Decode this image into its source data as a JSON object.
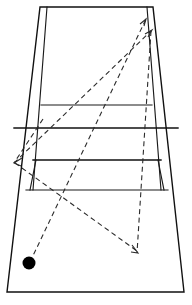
{
  "figure": {
    "caption": "",
    "background_color": "#ffffff",
    "line_color": "#111111",
    "trajectory_color": "#2b2b2b",
    "ball_color": "#000000",
    "view": "perspective-from-near-baseline",
    "width": 192,
    "height": 305
  },
  "chart_data": {
    "type": "diagram",
    "xlabel": "",
    "ylabel": "",
    "xlim": [
      0,
      192
    ],
    "ylim": [
      0,
      305
    ],
    "grid": false,
    "legend": "none",
    "court": {
      "perspective_outline": {
        "label": "doubles court outline",
        "points": [
          [
            40,
            7
          ],
          [
            153,
            7
          ],
          [
            184,
            292
          ],
          [
            7,
            292
          ]
        ]
      },
      "singles_sidelines": {
        "left": {
          "label": "left singles sideline",
          "points": [
            [
              47,
              7
            ],
            [
              33,
              190
            ]
          ]
        },
        "right": {
          "label": "right singles sideline",
          "points": [
            [
              147,
              7
            ],
            [
              161,
              190
            ]
          ]
        }
      },
      "horizontal_lines": [
        {
          "label": "far baseline",
          "y": 7,
          "x1": 40,
          "x2": 153
        },
        {
          "label": "far service line",
          "y": 105,
          "x1": 41,
          "x2": 152
        },
        {
          "label": "net line",
          "y": 128,
          "x1": 14,
          "x2": 178
        },
        {
          "label": "near service line",
          "y": 160,
          "x1": 33,
          "x2": 161
        },
        {
          "label": "near doubles service boundary",
          "y": 190,
          "x1": 26,
          "x2": 168
        },
        {
          "label": "near baseline",
          "y": 292,
          "x1": 7,
          "x2": 184
        }
      ]
    },
    "trajectories": [
      {
        "name": "shot-1-outgoing",
        "style": "dashed",
        "from": [
          30,
          262
        ],
        "to": [
          146,
          19
        ],
        "arrow_at": "to",
        "arrow_direction": "up-right",
        "note": "ball struck from near-left court toward far right corner"
      },
      {
        "name": "shot-2-outgoing",
        "style": "dashed",
        "from": [
          14,
          163
        ],
        "to": [
          151,
          31
        ],
        "arrow_at": "to",
        "arrow_direction": "up-right",
        "note": "second trajectory converging at far right corner"
      },
      {
        "name": "shot-3-return",
        "style": "dashed",
        "from": [
          151,
          31
        ],
        "to": [
          137,
          253
        ],
        "arrow_at": "to",
        "arrow_direction": "down-right",
        "note": "return trajectory toward near court"
      },
      {
        "name": "shot-4-return",
        "style": "dashed",
        "from": [
          43,
          119
        ],
        "to": [
          14,
          163
        ],
        "arrow_at": "to",
        "arrow_direction": "down-left",
        "note": "short trajectory toward left service area"
      }
    ],
    "markers": [
      {
        "name": "ball",
        "shape": "filled-circle",
        "position": [
          29,
          263
        ],
        "radius": 6.5,
        "color": "#000000",
        "label": "ball"
      }
    ]
  }
}
